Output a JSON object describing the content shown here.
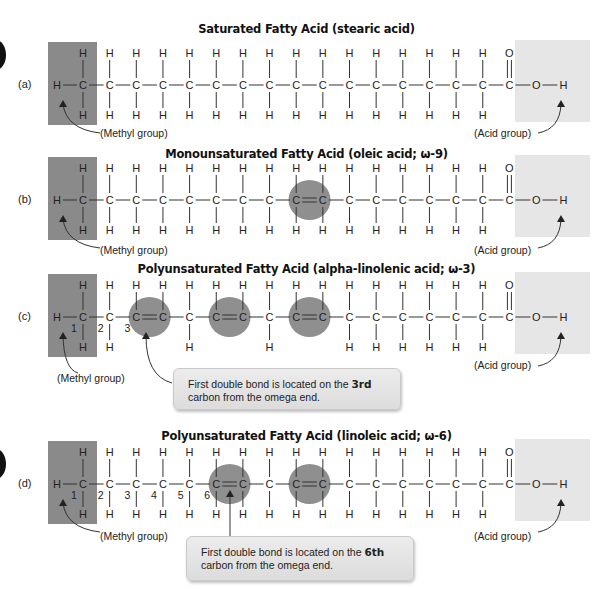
{
  "figure": {
    "colors": {
      "methyl_box": "#8a8a8a",
      "acid_box": "#e6e6e6",
      "double_bond_circle": "#8f8f8f",
      "text": "#222222"
    }
  },
  "rows": [
    {
      "letter": "(a)",
      "title": "Saturated Fatty Acid (stearic acid)",
      "methyl_label": "(Methyl group)",
      "acid_label": "(Acid group)",
      "double_bonds": [],
      "numbering": [],
      "callout": null
    },
    {
      "letter": "(b)",
      "title": "Monounsaturated Fatty Acid (oleic acid; ω-9)",
      "methyl_label": "(Methyl group)",
      "acid_label": "(Acid group)",
      "double_bonds": [
        9
      ],
      "numbering": [],
      "callout": null
    },
    {
      "letter": "(c)",
      "title": "Polyunsaturated Fatty Acid (alpha-linolenic acid; ω-3)",
      "methyl_label": "(Methyl group)",
      "acid_label": "(Acid group)",
      "double_bonds": [
        3,
        6,
        9
      ],
      "numbering": [
        "1",
        "2",
        "3"
      ],
      "callout": {
        "text_before": "First double bond is located on the ",
        "text_bold": "3rd",
        "text_after": " carbon from the omega end."
      }
    },
    {
      "letter": "(d)",
      "title": "Polyunsaturated Fatty Acid (linoleic acid; ω-6)",
      "methyl_label": "(Methyl group)",
      "acid_label": "(Acid group)",
      "double_bonds": [
        6,
        9
      ],
      "numbering": [
        "1",
        "2",
        "3",
        "4",
        "5",
        "6"
      ],
      "callout": {
        "text_before": "First double bond is located on the ",
        "text_bold": "6th",
        "text_after": " carbon from the omega end."
      }
    }
  ],
  "atoms": {
    "carbon": "C",
    "hydrogen": "H",
    "oxygen": "O"
  }
}
